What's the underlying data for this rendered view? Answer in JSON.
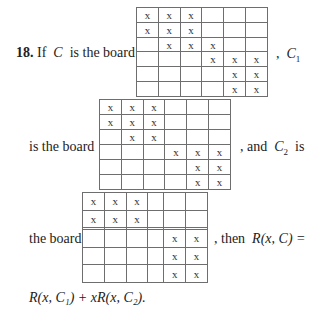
{
  "problem": {
    "number": "18.",
    "line1_prefix": "If",
    "var_C": "C",
    "line1_rest": "is the board",
    "line1_suffix_comma": ",",
    "var_C1": "C",
    "sub_1": "1",
    "line2_prefix": "is the board",
    "line2_suffix": ", and",
    "var_C2": "C",
    "sub_2": "2",
    "line2_is": "is",
    "line3_prefix": "the board",
    "line3_suffix": ", then",
    "rc_left": "R(x, C) =",
    "final_line": "R(x, C₁) + xR(x, C₂)."
  },
  "mark": "x",
  "boards": {
    "C": {
      "rows": [
        [
          1,
          1,
          1,
          0,
          0,
          0
        ],
        [
          1,
          1,
          1,
          0,
          0,
          0
        ],
        [
          0,
          1,
          1,
          1,
          0,
          0
        ],
        [
          0,
          0,
          0,
          1,
          1,
          1
        ],
        [
          0,
          0,
          0,
          0,
          1,
          1
        ],
        [
          0,
          0,
          0,
          0,
          1,
          1
        ]
      ]
    },
    "C1": {
      "rows": [
        [
          1,
          1,
          1,
          0,
          0,
          0
        ],
        [
          1,
          1,
          1,
          0,
          0,
          0
        ],
        [
          0,
          1,
          1,
          0,
          0,
          0
        ],
        [
          0,
          0,
          0,
          1,
          1,
          1
        ],
        [
          0,
          0,
          0,
          0,
          1,
          1
        ],
        [
          0,
          0,
          0,
          0,
          1,
          1
        ]
      ]
    },
    "C2": {
      "rows": [
        [
          1,
          1,
          1,
          0,
          0,
          0
        ],
        [
          1,
          1,
          1,
          0,
          0,
          0
        ],
        [
          0,
          0,
          0,
          0,
          0,
          0
        ],
        [
          0,
          0,
          0,
          0,
          1,
          1
        ],
        [
          0,
          0,
          0,
          0,
          1,
          1
        ],
        [
          0,
          0,
          0,
          0,
          1,
          1
        ]
      ]
    }
  }
}
